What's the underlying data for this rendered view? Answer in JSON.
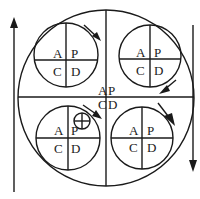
{
  "diagram": {
    "type": "pdca-cycle-nested",
    "center_labels": {
      "a": "A",
      "p": "P",
      "c": "C",
      "d": "D"
    },
    "sub_cycles": [
      {
        "position": "top-left",
        "labels": {
          "a": "A",
          "p": "P",
          "c": "C",
          "d": "D"
        }
      },
      {
        "position": "top-right",
        "labels": {
          "a": "A",
          "p": "P",
          "c": "C",
          "d": "D"
        }
      },
      {
        "position": "bottom-left",
        "labels": {
          "a": "A",
          "p": "P",
          "c": "C",
          "d": "D"
        },
        "marker": "crossed-circle"
      },
      {
        "position": "bottom-right",
        "labels": {
          "a": "A",
          "p": "P",
          "c": "C",
          "d": "D"
        }
      }
    ],
    "side_arrows": [
      {
        "side": "left",
        "direction": "up"
      },
      {
        "side": "right",
        "direction": "down"
      }
    ],
    "colors": {
      "stroke": "#1a1a1a",
      "background": "#ffffff"
    }
  }
}
